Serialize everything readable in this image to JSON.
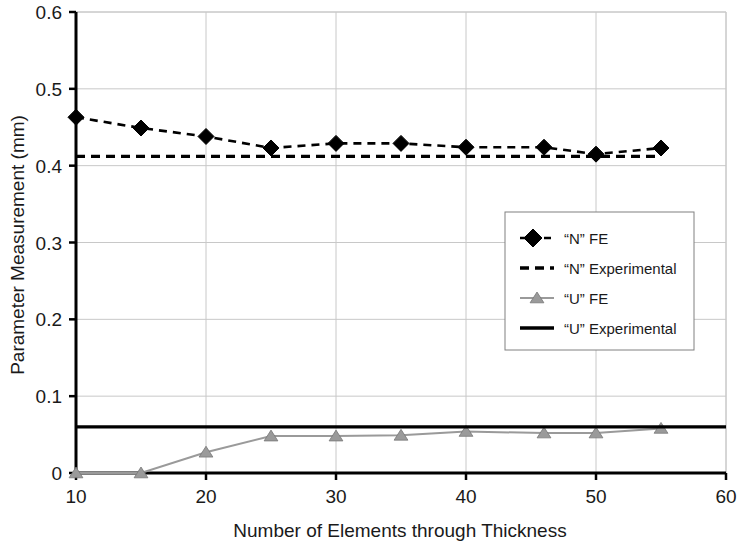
{
  "chart_data": {
    "type": "line",
    "title": "",
    "xlabel": "Number of Elements through Thickness",
    "ylabel": "Parameter Measurement (mm)",
    "xlim": [
      10,
      60
    ],
    "ylim": [
      0,
      0.6
    ],
    "xticks": [
      "10",
      "20",
      "30",
      "40",
      "50",
      "60"
    ],
    "xtick_values": [
      10,
      20,
      30,
      40,
      50,
      60
    ],
    "yticks": [
      "0",
      "0.1",
      "0.2",
      "0.3",
      "0.4",
      "0.5",
      "0.6"
    ],
    "ytick_values": [
      0,
      0.1,
      0.2,
      0.3,
      0.4,
      0.5,
      0.6
    ],
    "grid": true,
    "legend_position": "center-right",
    "series": [
      {
        "name": "“N” FE",
        "style": "dashed-with-diamond-markers",
        "color": "#000000",
        "marker": "diamond",
        "x": [
          10,
          15,
          20,
          25,
          30,
          35,
          40,
          46,
          50,
          55
        ],
        "values": [
          0.463,
          0.449,
          0.438,
          0.423,
          0.429,
          0.429,
          0.424,
          0.424,
          0.415,
          0.423
        ]
      },
      {
        "name": "“N” Experimental",
        "style": "dashed-line",
        "color": "#000000",
        "marker": "none",
        "x": [
          10,
          55
        ],
        "values": [
          0.412,
          0.412
        ]
      },
      {
        "name": "“U” FE",
        "style": "solid-with-triangle-markers",
        "color": "#9a9a9a",
        "marker": "triangle",
        "x": [
          10,
          15,
          20,
          25,
          30,
          35,
          40,
          46,
          50,
          55
        ],
        "values": [
          0.0,
          0.0,
          0.027,
          0.048,
          0.048,
          0.049,
          0.054,
          0.052,
          0.052,
          0.058
        ]
      },
      {
        "name": "“U” Experimental",
        "style": "solid-line",
        "color": "#000000",
        "marker": "none",
        "x": [
          10,
          60
        ],
        "values": [
          0.06,
          0.06
        ]
      }
    ],
    "legend": [
      {
        "label": "“N” FE",
        "swatch": "dashed-diamond",
        "color": "#000000"
      },
      {
        "label": "“N” Experimental",
        "swatch": "dashed",
        "color": "#000000"
      },
      {
        "label": "“U” FE",
        "swatch": "solid-triangle",
        "color": "#9a9a9a"
      },
      {
        "label": "“U” Experimental",
        "swatch": "solid",
        "color": "#000000"
      }
    ]
  }
}
